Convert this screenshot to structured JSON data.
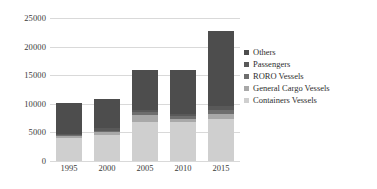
{
  "chart_data": {
    "type": "bar",
    "subtype": "stacked-column",
    "title": "",
    "xlabel": "",
    "ylabel": "",
    "categories": [
      "1995",
      "2000",
      "2005",
      "2010",
      "2015"
    ],
    "ylim": [
      0,
      25000
    ],
    "yticks": [
      0,
      5000,
      10000,
      15000,
      20000,
      25000
    ],
    "ytick_labels": [
      "0",
      "5000",
      "10000",
      "15000",
      "20000",
      "25000"
    ],
    "grid": true,
    "legend_position": "right",
    "series": [
      {
        "name": "Others",
        "color": "#4d4d4d",
        "values": [
          5400,
          5200,
          7000,
          7600,
          13200
        ]
      },
      {
        "name": "Passengers",
        "color": "#595959",
        "values": [
          300,
          400,
          500,
          500,
          700
        ]
      },
      {
        "name": "RORO Vessels",
        "color": "#6e6e6e",
        "values": [
          200,
          300,
          400,
          400,
          600
        ]
      },
      {
        "name": "General Cargo Vessels",
        "color": "#a8a8a8",
        "values": [
          300,
          400,
          1200,
          500,
          1000
        ]
      },
      {
        "name": "Containers Vessels",
        "color": "#cfcfcf",
        "values": [
          4000,
          4600,
          6900,
          6900,
          7300
        ]
      }
    ],
    "totals": [
      10200,
      10900,
      16000,
      15900,
      22800
    ],
    "stack_order_bottom_to_top": [
      "Containers Vessels",
      "General Cargo Vessels",
      "RORO Vessels",
      "Passengers",
      "Others"
    ],
    "colors": {
      "gridline": "#d9d9d9",
      "text": "#3a3a3a",
      "background": "#ffffff"
    }
  }
}
